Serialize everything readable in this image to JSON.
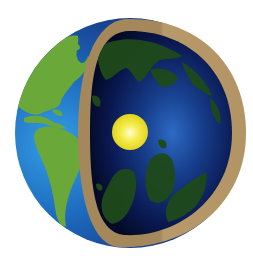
{
  "illustration": {
    "title": "Earth cross-section",
    "layers": [
      {
        "name": "inner core",
        "color": "#f2e83a"
      },
      {
        "name": "mantle / interior",
        "color": "#0a1a4a"
      },
      {
        "name": "crust",
        "color": "#a88a5a"
      },
      {
        "name": "ocean",
        "color": "#1f5fa8"
      },
      {
        "name": "continents",
        "color": "#6aa83a"
      }
    ]
  },
  "colors": {
    "background": "#ffffff",
    "ocean_light": "#2f8fd8",
    "ocean_mid": "#1d4f9a",
    "ocean_dark": "#10286a",
    "land": "#6aa83a",
    "land_dark": "#4a8a2a",
    "interior_center": "#2a5db8",
    "interior_edge": "#050a28",
    "interior_land": "#1f4a1a",
    "crust_left": "#a4875a",
    "crust_right": "#b8996a",
    "core_center": "#fffbd0",
    "core_edge": "#e8dc1c"
  }
}
